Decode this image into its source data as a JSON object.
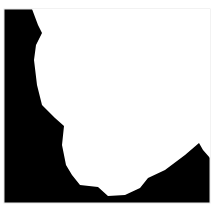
{
  "image": {
    "width": 218,
    "height": 209,
    "background_color": "#ffffff",
    "mask": {
      "frame": {
        "x": 4,
        "y": 9,
        "width": 206,
        "height": 194
      },
      "foreground_color": "#ffffff",
      "background_color": "#000000",
      "border_color": "#e6e6e6",
      "white_region_polygon": "32,9 210,9 210,158 203,150 199,143 185,155 165,170 148,178 140,188 125,195 108,196 98,187 80,185 72,175 66,165 62,145 64,126 55,118 42,105 37,85 34,60 36,45 42,33 38,25"
    }
  }
}
